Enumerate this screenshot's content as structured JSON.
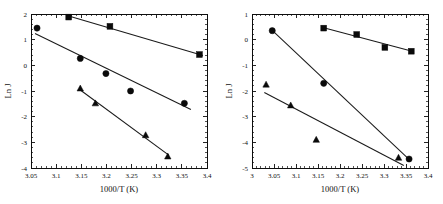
{
  "figure": {
    "name": "arrhenius-plots",
    "panel_count": 2
  },
  "chart_data": [
    {
      "id": "left",
      "type": "scatter",
      "title": "",
      "xlabel": "1000/T (K)",
      "ylabel": "Ln J",
      "xlim": [
        3.05,
        3.4
      ],
      "ylim": [
        -4,
        2
      ],
      "xticks": [
        3.05,
        3.1,
        3.15,
        3.2,
        3.25,
        3.3,
        3.35,
        3.4
      ],
      "xticklabels": [
        "3.05",
        "3.1",
        "3.15",
        "3.2",
        "3.25",
        "3.3",
        "3.35",
        "3.4"
      ],
      "yticks": [
        -4,
        -3,
        -2,
        -1,
        0,
        1,
        2
      ],
      "yticklabels": [
        "-4",
        "-3",
        "-2",
        "-1",
        "0",
        "1",
        "2"
      ],
      "grid": false,
      "legend": "none",
      "minor_ticks_x": 5,
      "minor_ticks_y": 5,
      "series": [
        {
          "name": "square-series",
          "marker": "square",
          "x": [
            3.125,
            3.207,
            3.385
          ],
          "y": [
            1.88,
            1.52,
            0.42
          ],
          "fit": {
            "x": [
              3.125,
              3.392
            ],
            "y": [
              1.92,
              0.38
            ]
          }
        },
        {
          "name": "circle-series",
          "marker": "circle",
          "x": [
            3.062,
            3.148,
            3.199,
            3.248,
            3.355
          ],
          "y": [
            1.45,
            0.27,
            -0.32,
            -1.0,
            -1.48
          ],
          "fit": {
            "x": [
              3.058,
              3.368
            ],
            "y": [
              1.24,
              -1.72
            ]
          }
        },
        {
          "name": "triangle-series",
          "marker": "triangle",
          "x": [
            3.148,
            3.178,
            3.278,
            3.322
          ],
          "y": [
            -0.9,
            -1.48,
            -2.72,
            -3.55
          ],
          "fit": {
            "x": [
              3.146,
              3.324
            ],
            "y": [
              -0.93,
              -3.5
            ]
          }
        }
      ]
    },
    {
      "id": "right",
      "type": "scatter",
      "title": "",
      "xlabel": "1000/T (K)",
      "ylabel": "Ln J",
      "xlim": [
        3.0,
        3.4
      ],
      "ylim": [
        -5,
        1
      ],
      "xticks": [
        3.0,
        3.05,
        3.1,
        3.15,
        3.2,
        3.25,
        3.3,
        3.35,
        3.4
      ],
      "xticklabels": [
        "3",
        "3.05",
        "3.1",
        "3.15",
        "3.2",
        "3.25",
        "3.3",
        "3.35",
        "3.4"
      ],
      "yticks": [
        -5,
        -4,
        -3,
        -2,
        -1,
        0,
        1
      ],
      "yticklabels": [
        "-5",
        "-4",
        "-3",
        "-2",
        "-1",
        "0",
        "1"
      ],
      "grid": false,
      "legend": "none",
      "minor_ticks_x": 5,
      "minor_ticks_y": 5,
      "series": [
        {
          "name": "square-series",
          "marker": "square",
          "x": [
            3.163,
            3.238,
            3.302,
            3.362
          ],
          "y": [
            0.45,
            0.2,
            -0.3,
            -0.45
          ],
          "fit": {
            "x": [
              3.163,
              3.364
            ],
            "y": [
              0.46,
              -0.45
            ]
          }
        },
        {
          "name": "circle-series",
          "marker": "circle",
          "x": [
            3.046,
            3.163,
            3.357
          ],
          "y": [
            0.35,
            -1.7,
            -4.65
          ],
          "fit": {
            "x": [
              3.046,
              3.357
            ],
            "y": [
              0.36,
              -4.66
            ]
          }
        },
        {
          "name": "triangle-series",
          "marker": "triangle",
          "x": [
            3.032,
            3.088,
            3.146,
            3.333
          ],
          "y": [
            -1.75,
            -2.56,
            -3.9,
            -4.6
          ],
          "fit": {
            "x": [
              3.028,
              3.345
            ],
            "y": [
              -2.06,
              -4.9
            ]
          }
        }
      ]
    }
  ]
}
